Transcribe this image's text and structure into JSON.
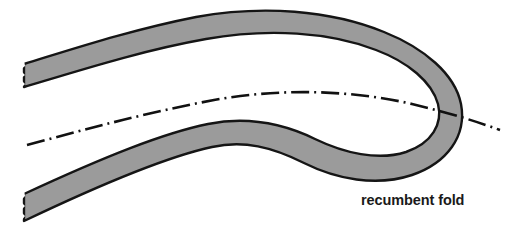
{
  "figure": {
    "title": "recumbent fold",
    "type": "geological-cross-section",
    "width": 512,
    "height": 235,
    "background_color": "#ffffff"
  },
  "labels": {
    "recumbent_fold": "recumbent fold"
  },
  "colors": {
    "stratum_fill": "#9b9b9b",
    "stratum_outline": "#151515",
    "axial_trace": "#111111",
    "label_text": "#1a1a1a",
    "background": "#ffffff"
  },
  "elements": {
    "stratum_band_name": "folded stratum band",
    "axial_trace_name": "axial trace",
    "hinge_name": "fold hinge",
    "upper_limb_name": "upper limb",
    "lower_limb_name": "lower limb"
  },
  "geometry": {
    "stratum_band_path": "M 24 64 C 70 50 130 30 196 17 C 262 5 330 10 384 32 C 424 48 455 74 461 104 C 467 136 447 163 412 175 C 376 187 336 179 304 163 C 272 147 244 140 212 147 C 170 156 110 180 24 221 L 24 194 C 106 156 164 133 208 124 C 248 116 282 123 315 139 C 344 153 378 161 406 152 C 432 143 443 124 438 104 C 432 82 408 62 376 50 C 330 32 268 28 206 39 C 144 50 84 69 24 87 Z",
    "axial_trace_path": "M 27 145 C 90 128 150 112 214 100 C 280 88 352 90 412 104 C 450 113 478 122 500 130",
    "upper_band_outer_start": [
      24,
      64
    ],
    "upper_band_crest": [
      240,
      12
    ],
    "hinge_center": [
      452,
      112
    ],
    "lower_band_outer_start": [
      24,
      221
    ],
    "axial_trace_left_end": [
      27,
      145
    ],
    "axial_trace_right_end": [
      500,
      130
    ],
    "dash_pattern": "18 5 2 5"
  }
}
